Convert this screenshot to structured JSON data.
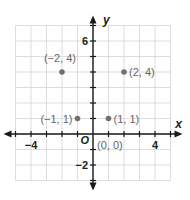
{
  "chart_data": {
    "type": "scatter",
    "title": "",
    "xlabel": "x",
    "ylabel": "y",
    "origin_label": "O",
    "xlim": [
      -5,
      5
    ],
    "ylim": [
      -3,
      7
    ],
    "grid": true,
    "x_ticks": [
      {
        "value": -4,
        "label": "−4"
      },
      {
        "value": 4,
        "label": "4"
      }
    ],
    "y_ticks": [
      {
        "value": 6,
        "label": "6"
      },
      {
        "value": -2,
        "label": "−2"
      }
    ],
    "points": [
      {
        "x": -2,
        "y": 4,
        "label": "(−2, 4)",
        "label_pos": "above"
      },
      {
        "x": 2,
        "y": 4,
        "label": "(2, 4)",
        "label_pos": "right"
      },
      {
        "x": -1,
        "y": 1,
        "label": "(−1, 1)",
        "label_pos": "left"
      },
      {
        "x": 1,
        "y": 1,
        "label": "(1, 1)",
        "label_pos": "right"
      },
      {
        "x": 0,
        "y": 0,
        "label": "(0, 0)",
        "label_pos": "below-right",
        "marker": false
      }
    ],
    "colors": {
      "point": "#707070",
      "label": "#666666",
      "axis": "#1a1a1a",
      "grid": "#d4d4d4"
    }
  }
}
